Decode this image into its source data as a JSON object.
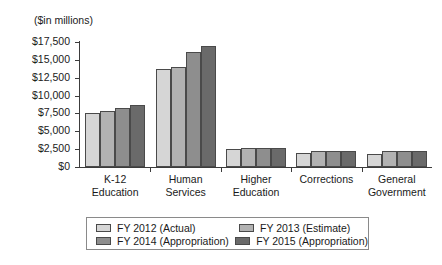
{
  "chart_data": {
    "type": "bar",
    "title": "($in millions)",
    "xlabel": "",
    "ylabel": "",
    "ylim": [
      0,
      17500
    ],
    "ytick_step": 2500,
    "grid": false,
    "legend_position": "bottom",
    "ytick_labels": [
      "$17,500",
      "$15,000",
      "$12,500",
      "$10,000",
      "$7,500",
      "$5,000",
      "$2,500",
      "$0"
    ],
    "ytick_values": [
      17500,
      15000,
      12500,
      10000,
      7500,
      5000,
      2500,
      0
    ],
    "categories": [
      [
        "K-12",
        "Education"
      ],
      [
        "Human",
        "Services"
      ],
      [
        "Higher",
        "Education"
      ],
      [
        "Corrections",
        ""
      ],
      [
        "General",
        "Government"
      ]
    ],
    "category_names": [
      "K-12 Education",
      "Human Services",
      "Higher Education",
      "Corrections",
      "General Government"
    ],
    "series": [
      {
        "name": "FY 2012 (Actual)",
        "color": "#d6d6d6",
        "values": [
          7550,
          13700,
          2500,
          2000,
          1850
        ]
      },
      {
        "name": "FY 2013 (Estimate)",
        "color": "#b2b2b2",
        "values": [
          7800,
          14050,
          2650,
          2250,
          2250
        ]
      },
      {
        "name": "FY 2014 (Appropriation)",
        "color": "#8e8e8e",
        "values": [
          8200,
          16100,
          2650,
          2200,
          2250
        ]
      },
      {
        "name": "FY 2015 (Appropriation)",
        "color": "#6a6a6a",
        "values": [
          8700,
          16900,
          2650,
          2250,
          2250
        ]
      }
    ]
  },
  "legend": {
    "entries": [
      "FY 2012 (Actual)",
      "FY 2013 (Estimate)",
      "FY 2014 (Appropriation)",
      "FY 2015 (Appropriation)"
    ]
  }
}
